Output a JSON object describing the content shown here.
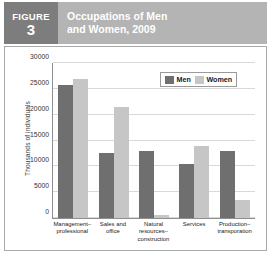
{
  "figure": {
    "tag_word": "FIGURE",
    "number": "3",
    "title_line1": "Occupations of Men",
    "title_line2": "and Women, 2009",
    "banner_bg": "#b4b4b4",
    "tag_bg": "#7d7d7d"
  },
  "legend": {
    "items": [
      {
        "label": "Men",
        "color": "#6f6f6f"
      },
      {
        "label": "Women",
        "color": "#c6c6c6"
      }
    ]
  },
  "chart_data": {
    "type": "bar",
    "title": "Occupations of Men and Women, 2009",
    "xlabel": "",
    "ylabel": "Thousands of individuals",
    "ylim": [
      0,
      30000
    ],
    "yticks": [
      0,
      5000,
      10000,
      15000,
      20000,
      25000,
      30000
    ],
    "ytick_labels": [
      "0",
      "5000",
      "10000",
      "15000",
      "20000",
      "25000",
      "30000"
    ],
    "grid": true,
    "legend_position": "top-right",
    "categories": [
      "Management–\nprofessional",
      "Sales and\noffice",
      "Natural resources–\nconstruction",
      "Services",
      "Production–\ntransporation"
    ],
    "series": [
      {
        "name": "Men",
        "color": "#6f6f6f",
        "values": [
          25800,
          12500,
          13000,
          10500,
          13000
        ]
      },
      {
        "name": "Women",
        "color": "#c6c6c6",
        "values": [
          27000,
          21500,
          600,
          14000,
          3400
        ]
      }
    ]
  }
}
